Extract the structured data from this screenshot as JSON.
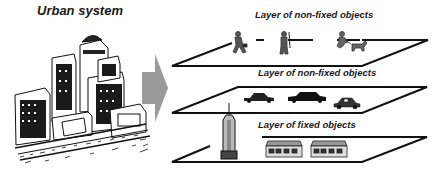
{
  "diagram": {
    "left_panel": {
      "title": "Urban system",
      "illustration": "city-buildings-sketch"
    },
    "arrow": {
      "direction": "right",
      "color": "#9a9a9a"
    },
    "layers": [
      {
        "label": "Layer of non-fixed objects",
        "objects": [
          "walking-man-with-briefcase",
          "hiker-with-stick",
          "child-running-with-dog"
        ]
      },
      {
        "label": "Layer of non-fixed objects",
        "objects": [
          "sedan-car",
          "limousine-car",
          "hatchback-car"
        ]
      },
      {
        "label": "Layer of fixed objects",
        "objects": [
          "skyscraper-tower",
          "row-house",
          "row-house"
        ]
      }
    ],
    "colors": {
      "line": "#111111",
      "text": "#1a1a1a",
      "arrow": "#9a9a9a",
      "figure_gray": "#555555"
    }
  }
}
